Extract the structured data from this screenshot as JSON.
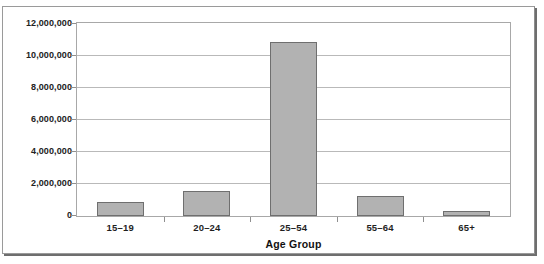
{
  "chart_data": {
    "type": "bar",
    "title": "",
    "xlabel": "Age Group",
    "ylabel": "",
    "categories": [
      "15–19",
      "20–24",
      "25–54",
      "55–64",
      "65+"
    ],
    "values": [
      860000,
      1540000,
      10900000,
      1230000,
      300000
    ],
    "ylim": [
      0,
      12000000
    ],
    "ytick_labels": [
      "0",
      "2,000,000",
      "4,000,000",
      "6,000,000",
      "8,000,000",
      "10,000,000",
      "12,000,000"
    ],
    "ytick_values": [
      0,
      2000000,
      4000000,
      6000000,
      8000000,
      10000000,
      12000000
    ],
    "grid": true,
    "legend": null,
    "bar_color": "#b2b2b2",
    "bar_border_color": "#6f6f6f",
    "gridline_color": "#b9b9b9",
    "plot_border_color": "#a8a8a8",
    "frame_color": "#9a9a9a",
    "text_color": "#1f1f1f"
  },
  "figure": {
    "clipped_title": "",
    "axis_title": "Age Group"
  }
}
